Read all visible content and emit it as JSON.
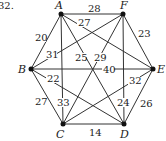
{
  "problem_number": "32.",
  "vertices": [
    {
      "id": "A",
      "x": 61,
      "y": 14,
      "lx": 55,
      "ly": 9
    },
    {
      "id": "F",
      "x": 123,
      "y": 14,
      "lx": 120,
      "ly": 9
    },
    {
      "id": "B",
      "x": 31,
      "y": 69,
      "lx": 18,
      "ly": 73
    },
    {
      "id": "E",
      "x": 153,
      "y": 69,
      "lx": 157,
      "ly": 73
    },
    {
      "id": "C",
      "x": 63,
      "y": 124,
      "lx": 56,
      "ly": 138
    },
    {
      "id": "D",
      "x": 124,
      "y": 124,
      "lx": 120,
      "ly": 138
    }
  ],
  "edges": [
    {
      "from": "A",
      "to": "F",
      "weight": "28",
      "lx": 88,
      "ly": 12
    },
    {
      "from": "A",
      "to": "E",
      "weight": "27",
      "lx": 78,
      "ly": 26
    },
    {
      "from": "A",
      "to": "B",
      "weight": "20",
      "lx": 35,
      "ly": 41
    },
    {
      "from": "A",
      "to": "C",
      "weight": "33",
      "lx": 57,
      "ly": 106
    },
    {
      "from": "A",
      "to": "D",
      "weight": "25",
      "lx": 75,
      "ly": 61
    },
    {
      "from": "F",
      "to": "B",
      "weight": "31",
      "lx": 46,
      "ly": 58
    },
    {
      "from": "F",
      "to": "C",
      "weight": "29",
      "lx": 94,
      "ly": 61
    },
    {
      "from": "F",
      "to": "E",
      "weight": "23",
      "lx": 138,
      "ly": 37
    },
    {
      "from": "F",
      "to": "D",
      "weight": "24",
      "lx": 117,
      "ly": 106
    },
    {
      "from": "B",
      "to": "E",
      "weight": "40",
      "lx": 103,
      "ly": 73
    },
    {
      "from": "B",
      "to": "D",
      "weight": "22",
      "lx": 47,
      "ly": 82
    },
    {
      "from": "B",
      "to": "C",
      "weight": "27",
      "lx": 35,
      "ly": 105
    },
    {
      "from": "C",
      "to": "E",
      "weight": "32",
      "lx": 129,
      "ly": 84
    },
    {
      "from": "C",
      "to": "D",
      "weight": "14",
      "lx": 89,
      "ly": 136
    },
    {
      "from": "D",
      "to": "E",
      "weight": "26",
      "lx": 140,
      "ly": 107
    }
  ]
}
